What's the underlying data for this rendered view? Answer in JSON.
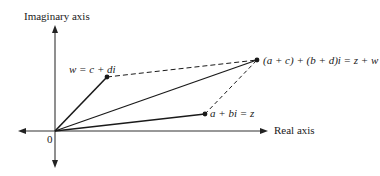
{
  "diagram": {
    "axes": {
      "imaginary_label": "Imaginary axis",
      "real_label": "Real axis",
      "origin_label": "0"
    },
    "points": {
      "z": {
        "label": "a + bi = z"
      },
      "w": {
        "label": "w = c + di"
      },
      "sum": {
        "label": "(a + c) + (b + d)i = z + w"
      }
    },
    "colors": {
      "ink": "#1a1a1a",
      "axis": "#333333"
    }
  }
}
